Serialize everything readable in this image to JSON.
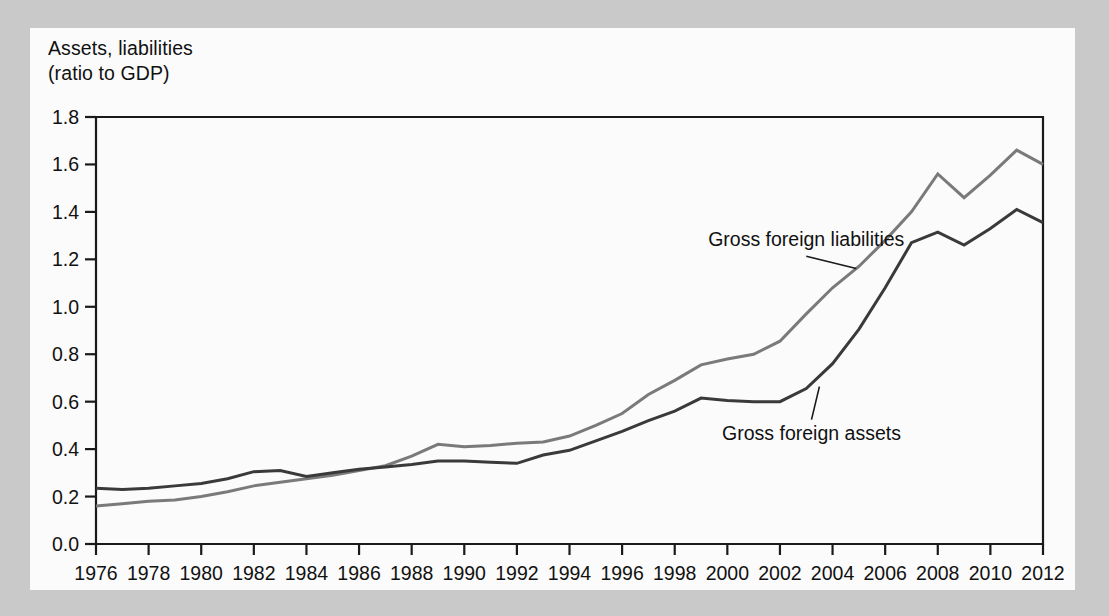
{
  "figure": {
    "axis_caption": "Assets, liabilities\n(ratio to GDP)",
    "background_color": "#c9c9c9",
    "card_color": "#fbfbfb"
  },
  "chart_data": {
    "type": "line",
    "title": "",
    "subtitle": "",
    "xlabel": "",
    "ylabel": "Assets, liabilities (ratio to GDP)",
    "xlim": [
      1976,
      2012
    ],
    "ylim": [
      0.0,
      1.8
    ],
    "grid": false,
    "legend_position": "inline-annotations",
    "ytick_labels": [
      "0.0",
      "0.2",
      "0.4",
      "0.6",
      "0.8",
      "1.0",
      "1.2",
      "1.4",
      "1.6",
      "1.8"
    ],
    "ytick_values": [
      0.0,
      0.2,
      0.4,
      0.6,
      0.8,
      1.0,
      1.2,
      1.4,
      1.6,
      1.8
    ],
    "xtick_labels": [
      "1976",
      "1978",
      "1980",
      "1982",
      "1984",
      "1986",
      "1988",
      "1990",
      "1992",
      "1994",
      "1996",
      "1998",
      "2000",
      "2002",
      "2004",
      "2006",
      "2008",
      "2010",
      "2012"
    ],
    "xtick_values": [
      1976,
      1978,
      1980,
      1982,
      1984,
      1986,
      1988,
      1990,
      1992,
      1994,
      1996,
      1998,
      2000,
      2002,
      2004,
      2006,
      2008,
      2010,
      2012
    ],
    "x": [
      1976,
      1977,
      1978,
      1979,
      1980,
      1981,
      1982,
      1983,
      1984,
      1985,
      1986,
      1987,
      1988,
      1989,
      1990,
      1991,
      1992,
      1993,
      1994,
      1995,
      1996,
      1997,
      1998,
      1999,
      2000,
      2001,
      2002,
      2003,
      2004,
      2005,
      2006,
      2007,
      2008,
      2009,
      2010,
      2011,
      2012
    ],
    "series": [
      {
        "name": "Gross foreign liabilities",
        "color": "#7a7a7a",
        "line_width": 3.0,
        "values": [
          0.16,
          0.17,
          0.18,
          0.185,
          0.2,
          0.22,
          0.245,
          0.26,
          0.275,
          0.29,
          0.31,
          0.33,
          0.37,
          0.42,
          0.41,
          0.415,
          0.425,
          0.43,
          0.455,
          0.5,
          0.55,
          0.63,
          0.69,
          0.755,
          0.78,
          0.8,
          0.855,
          0.97,
          1.08,
          1.17,
          1.28,
          1.4,
          1.56,
          1.46,
          1.555,
          1.66,
          1.6
        ]
      },
      {
        "name": "Gross foreign assets",
        "color": "#3a3a3a",
        "line_width": 3.0,
        "values": [
          0.235,
          0.23,
          0.235,
          0.245,
          0.255,
          0.275,
          0.305,
          0.31,
          0.285,
          0.3,
          0.315,
          0.325,
          0.335,
          0.35,
          0.35,
          0.345,
          0.34,
          0.375,
          0.395,
          0.435,
          0.475,
          0.52,
          0.56,
          0.615,
          0.605,
          0.6,
          0.6,
          0.655,
          0.76,
          0.905,
          1.08,
          1.27,
          1.315,
          1.26,
          1.33,
          1.41,
          1.355
        ]
      }
    ],
    "annotations": [
      {
        "text": "Gross foreign liabilities",
        "series": "Gross foreign liabilities",
        "label_x": 2003,
        "label_y": 1.255
      },
      {
        "text": "Gross foreign assets",
        "series": "Gross foreign assets",
        "label_x": 2003.2,
        "label_y": 0.44
      }
    ]
  }
}
